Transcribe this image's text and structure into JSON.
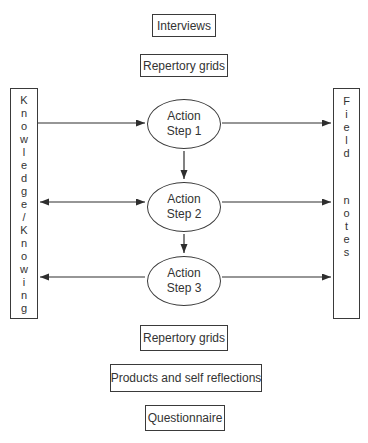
{
  "diagram": {
    "top_boxes": [
      {
        "label": "Interviews"
      },
      {
        "label": "Repertory grids"
      }
    ],
    "left_box": {
      "label": "Knowledge/Knowing"
    },
    "right_box": {
      "line1": "Field",
      "line2": "notes"
    },
    "steps": [
      {
        "label": "Action Step 1"
      },
      {
        "label": "Action Step 2"
      },
      {
        "label": "Action Step 3"
      }
    ],
    "bottom_boxes": [
      {
        "label": "Repertory grids"
      },
      {
        "label": "Products and self reflections"
      },
      {
        "label": "Questionnaire"
      }
    ],
    "colors": {
      "line": "#3a3a3a",
      "text": "#333333",
      "background": "#ffffff"
    }
  }
}
